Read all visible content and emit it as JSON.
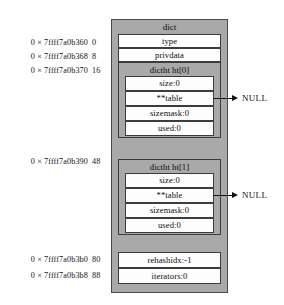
{
  "diagram": {
    "title": "dict",
    "addresses": [
      {
        "hex": "0 × 7ffff7a0b360",
        "offset": "0"
      },
      {
        "hex": "0 × 7ffff7a0b368",
        "offset": "8"
      },
      {
        "hex": "0 × 7ffff7a0b370",
        "offset": "16"
      },
      {
        "hex": "0 × 7ffff7a0b390",
        "offset": "48"
      },
      {
        "hex": "0 × 7ffff7a0b3b0",
        "offset": "80"
      },
      {
        "hex": "0 × 7ffff7a0b3b8",
        "offset": "88"
      }
    ],
    "fields": {
      "type": "type",
      "privdata": "privdata",
      "rehashidx": "rehashidx:-1",
      "iterators": "iterators:0"
    },
    "hashtables": [
      {
        "title": "dictht ht[0]",
        "size": "size:0",
        "table": "**table",
        "sizemask": "sizemask:0",
        "used": "used:0",
        "pointer_target": "NULL"
      },
      {
        "title": "dictht ht[1]",
        "size": "size:0",
        "table": "**table",
        "sizemask": "sizemask:0",
        "used": "used:0",
        "pointer_target": "NULL"
      }
    ],
    "colors": {
      "struct_fill": "#a9a9a9",
      "field_fill": "#fdfdfd",
      "border": "#3c3c3c",
      "text": "#0d0d0d"
    }
  }
}
